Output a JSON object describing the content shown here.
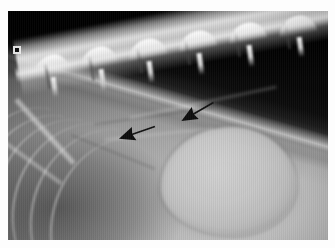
{
  "page": {
    "background_color": "#ffffff",
    "content_type": "radiograph-image"
  },
  "radiograph": {
    "modality": "X-ray",
    "view": "lateral",
    "region": "thorax-abdomen",
    "frame": {
      "left": 8,
      "top": 11,
      "width": 320,
      "height": 229,
      "background_color": "#0a0a0a"
    },
    "marker": {
      "name": "radiopaque-positioning-marker",
      "shape": "square",
      "fill_color": "#0d0d0d",
      "border_color": "#f2f2f2",
      "left": 5,
      "top": 35,
      "size": 8
    },
    "annotations": [
      {
        "id": "arrow-1",
        "type": "arrow",
        "color": "#101010",
        "points_to": "caudal-soft-tissue-margin",
        "tip_x": 119,
        "tip_y": 131,
        "tail_x": 146,
        "tail_y": 122,
        "angle_deg": 198
      },
      {
        "id": "arrow-2",
        "type": "arrow",
        "color": "#101010",
        "points_to": "cranial-soft-tissue-margin",
        "tip_x": 181,
        "tip_y": 119,
        "tail_x": 207,
        "tail_y": 104,
        "angle_deg": 210
      }
    ],
    "anatomy": {
      "gas_field": {
        "label": "air-gas-field",
        "location": "dorsal-cranial",
        "tone": "#050505"
      },
      "spine": {
        "label": "vertebral-column",
        "vertebrae_count": 6,
        "angle_deg": -10.5,
        "tone": "#ffffff"
      },
      "ribs": {
        "label": "rib-cage",
        "count": 6,
        "location": "cranioventral-left"
      },
      "mass": {
        "label": "rounded-soft-tissue-opacity",
        "location": "mid-caudal-abdomen",
        "tone": "#c9c9c9",
        "center_x": 220,
        "center_y": 170,
        "width": 135,
        "height": 108
      }
    }
  }
}
